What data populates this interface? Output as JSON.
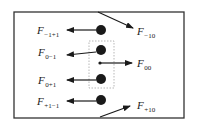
{
  "diagram": {
    "type": "force-diagram",
    "colors": {
      "stroke": "#1a1a1a",
      "frame": "#333333",
      "dashed_box": "#999999",
      "background": "#ffffff"
    },
    "frame": {
      "x": 14,
      "y": 12,
      "w": 170,
      "h": 106
    },
    "group_box": {
      "x": 89,
      "y": 41,
      "w": 25,
      "h": 47
    },
    "nodes": [
      {
        "id": "n-1+1",
        "x": 101,
        "y": 30,
        "r": 5
      },
      {
        "id": "n0-1",
        "x": 101,
        "y": 50,
        "r": 5
      },
      {
        "id": "n00",
        "x": 100,
        "y": 63,
        "r": 1.6
      },
      {
        "id": "n0+1",
        "x": 101,
        "y": 79,
        "r": 5
      },
      {
        "id": "n+1-1",
        "x": 101,
        "y": 100,
        "r": 5
      }
    ],
    "forces": [
      {
        "name": "F",
        "sub": "−1+1",
        "from": [
          96,
          30
        ],
        "to": [
          67,
          30
        ],
        "label_x": 37,
        "label_y": 34
      },
      {
        "name": "F",
        "sub": "−10",
        "from": [
          98,
          12
        ],
        "to": [
          133,
          28
        ],
        "label_x": 137,
        "label_y": 35
      },
      {
        "name": "F",
        "sub": "0−1",
        "from": [
          96,
          52
        ],
        "to": [
          67,
          55
        ],
        "label_x": 38,
        "label_y": 56
      },
      {
        "name": "F",
        "sub": "00",
        "from": [
          100,
          63
        ],
        "to": [
          132,
          63
        ],
        "label_x": 137,
        "label_y": 67
      },
      {
        "name": "F",
        "sub": "0+1",
        "from": [
          96,
          80
        ],
        "to": [
          67,
          80
        ],
        "label_x": 38,
        "label_y": 84
      },
      {
        "name": "F",
        "sub": "+1−1",
        "from": [
          96,
          101
        ],
        "to": [
          67,
          101
        ],
        "label_x": 37,
        "label_y": 105
      },
      {
        "name": "F",
        "sub": "+10",
        "from": [
          100,
          117
        ],
        "to": [
          130,
          106
        ],
        "label_x": 137,
        "label_y": 109
      }
    ]
  }
}
